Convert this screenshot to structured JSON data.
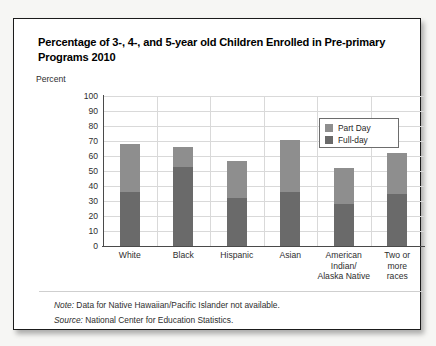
{
  "card": {
    "title": "Percentage of 3-, 4-, and 5-year old Children Enrolled in Pre-primary Programs 2010",
    "percent_axis_label": "Percent"
  },
  "notes": {
    "note_lead": "Note:",
    "note_text": " Data for Native Hawaiian/Pacific Islander not available.",
    "source_lead": "Source:",
    "source_text": " National Center for Education Statistics."
  },
  "legend": {
    "position": "top-right",
    "items": [
      {
        "label": "Part Day",
        "color": "#8e8e8e"
      },
      {
        "label": "Full-day",
        "color": "#6a6a6a"
      }
    ]
  },
  "chart_data": {
    "type": "bar",
    "subtype": "stacked-vertical",
    "title": "Percentage of 3-, 4-, and 5-year old Children Enrolled in Pre-primary Programs 2010",
    "xlabel": "",
    "ylabel": "Percent",
    "ylim": [
      0,
      100
    ],
    "yticks": [
      0,
      10,
      20,
      30,
      40,
      50,
      60,
      70,
      80,
      90,
      100
    ],
    "ytick_labels": [
      "0",
      "10",
      "20",
      "30",
      "40",
      "50",
      "60",
      "70",
      "80",
      "90",
      "100"
    ],
    "grid": true,
    "categories": [
      "White",
      "Black",
      "Hispanic",
      "Asian",
      "American Indian/ Alaska Native",
      "Two or more races"
    ],
    "category_lines": [
      [
        "White"
      ],
      [
        "Black"
      ],
      [
        "Hispanic"
      ],
      [
        "Asian"
      ],
      [
        "American",
        "Indian/",
        "Alaska Native"
      ],
      [
        "Two or",
        "more",
        "races"
      ]
    ],
    "series": [
      {
        "name": "Full-day",
        "color": "#6a6a6a",
        "values": [
          36,
          53,
          32,
          36,
          28,
          35
        ]
      },
      {
        "name": "Part Day",
        "color": "#8e8e8e",
        "values": [
          32,
          13,
          25,
          35,
          24,
          27
        ]
      }
    ],
    "totals": [
      68,
      66,
      57,
      71,
      52,
      62
    ]
  }
}
